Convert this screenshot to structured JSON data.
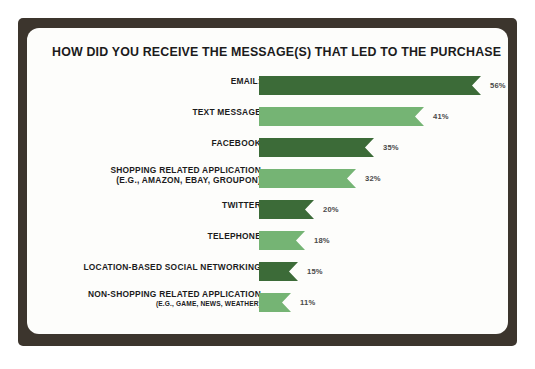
{
  "frame": {
    "border_color": "#3c352d",
    "card_color": "#fdfdfb"
  },
  "chart_data": {
    "type": "bar",
    "orientation": "horizontal",
    "title": "HOW DID YOU RECEIVE THE MESSAGE(S) THAT LED TO THE PURCHASE",
    "xlabel": "",
    "ylabel": "",
    "grid": false,
    "legend": "none",
    "value_suffix": "%",
    "xlim": [
      0,
      56
    ],
    "colors": {
      "dark_green": "#3c6b38",
      "light_green": "#75b474",
      "value_text": "#4a4a4a",
      "label_text": "#1b1b1b"
    },
    "categories": [
      "EMAIL:",
      "TEXT MESSAGE",
      "FACEBOOK",
      "SHOPPING RELATED APPLICATION",
      "TWITTER",
      "TELEPHONE",
      "LOCATION-BASED SOCIAL NETWORKING",
      "NON-SHOPPING RELATED APPLICATION"
    ],
    "values": [
      56,
      41,
      35,
      32,
      20,
      18,
      15,
      11
    ],
    "bars": [
      {
        "label": "EMAIL:",
        "sublabel": "",
        "value": 56,
        "value_text": "56%",
        "color": "#3c6b38",
        "bar_px": 222
      },
      {
        "label": "TEXT MESSAGE",
        "sublabel": "",
        "value": 41,
        "value_text": "41%",
        "color": "#75b474",
        "bar_px": 165
      },
      {
        "label": "FACEBOOK",
        "sublabel": "",
        "value": 35,
        "value_text": "35%",
        "color": "#3c6b38",
        "bar_px": 115
      },
      {
        "label": "SHOPPING RELATED APPLICATION",
        "sublabel": "(E.G., AMAZON, EBAY, GROUPON)",
        "value": 32,
        "value_text": "32%",
        "color": "#75b474",
        "bar_px": 97
      },
      {
        "label": "TWITTER",
        "sublabel": "",
        "value": 20,
        "value_text": "20%",
        "color": "#3c6b38",
        "bar_px": 55
      },
      {
        "label": "TELEPHONE",
        "sublabel": "",
        "value": 18,
        "value_text": "18%",
        "color": "#75b474",
        "bar_px": 46
      },
      {
        "label": "LOCATION-BASED SOCIAL NETWORKING",
        "sublabel": "",
        "value": 15,
        "value_text": "15%",
        "color": "#3c6b38",
        "bar_px": 39
      },
      {
        "label": "NON-SHOPPING RELATED APPLICATION",
        "sublabel": "(E.G., GAME, NEWS, WEATHER)",
        "value": 11,
        "value_text": "11%",
        "color": "#75b474",
        "bar_px": 32
      }
    ]
  }
}
